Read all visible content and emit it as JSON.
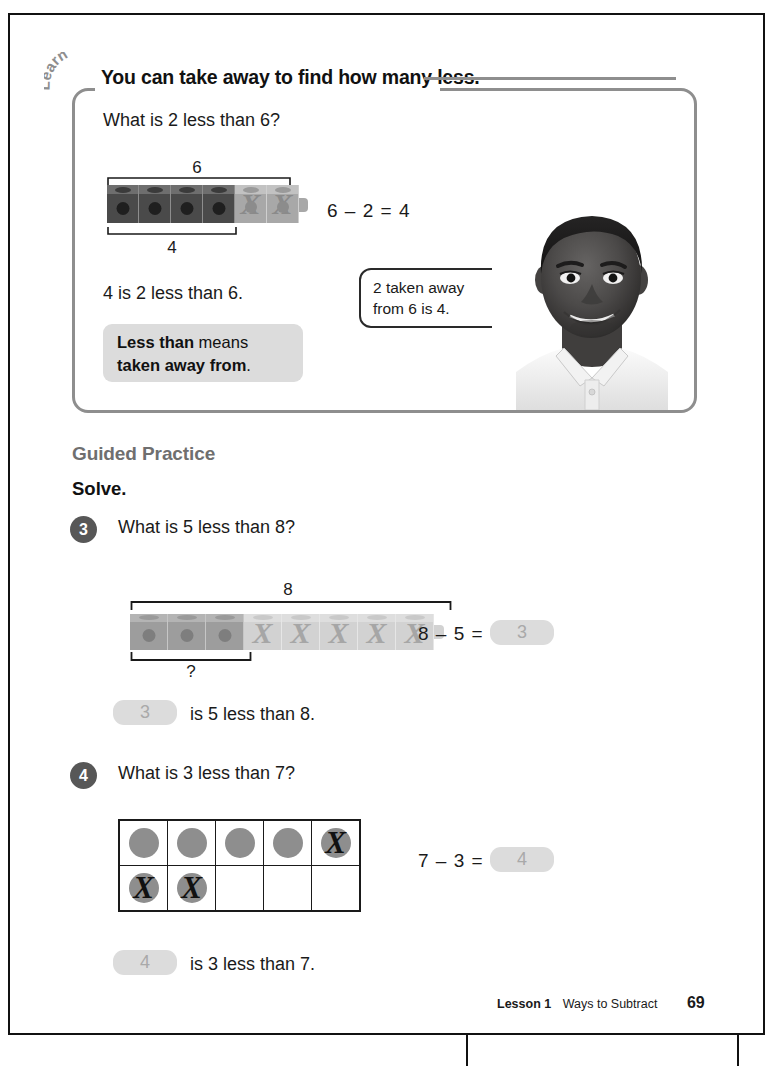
{
  "page": {
    "number": "69",
    "footer_lesson": "Lesson 1",
    "footer_title": "Ways to Subtract"
  },
  "learn": {
    "tab_label": "Learn",
    "heading": "You can take away to find how many less.",
    "question": "What is 2 less than 6?",
    "bracket_total_label": "6",
    "bracket_part_label": "4",
    "equation": "6 – 2 = 4",
    "statement": "4 is 2 less than 6.",
    "meaning_line1_bold": "Less than",
    "meaning_line1_rest": " means",
    "meaning_line2_bold": "taken away from",
    "meaning_line2_rest": ".",
    "bubble_line1": "2 taken away",
    "bubble_line2": "from 6 is 4.",
    "photo_alt": "photo-of-smiling-boy"
  },
  "guided_practice": {
    "section_title": "Guided Practice",
    "directions": "Solve."
  },
  "problems": [
    {
      "number": "3",
      "question": "What is 5 less than 8?",
      "bracket_total_label": "8",
      "bracket_part_label": "?",
      "equation_left": "8 – 5 =",
      "answer": "3",
      "statement_rest": "is 5 less than 8.",
      "statement_answer": "3",
      "model": "cube-train",
      "total_cubes": 8,
      "remaining_cubes": 3,
      "crossed_cubes": 5
    },
    {
      "number": "4",
      "question": "What is 3 less than 7?",
      "equation_left": "7 – 3 =",
      "answer": "4",
      "statement_rest": "is 3 less than 7.",
      "statement_answer": "4",
      "model": "ten-frame",
      "total_counters": 7,
      "crossed_counters": 3,
      "frame_rows": 2,
      "frame_cols": 5,
      "cells": [
        [
          "counter",
          "counter",
          "counter",
          "counter",
          "counter-crossed"
        ],
        [
          "counter-crossed",
          "counter-crossed",
          "empty",
          "empty",
          "empty"
        ]
      ]
    }
  ],
  "colors": {
    "page_border": "#111111",
    "learn_box_border": "#8e8e8e",
    "badge_bg": "#575757",
    "pill_bg": "#dcdcdc",
    "pill_text": "#a9a9a9",
    "section_title": "#6f6f6f",
    "counter": "#8e8e8e"
  }
}
